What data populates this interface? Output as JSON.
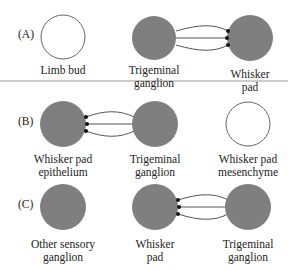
{
  "colors": {
    "filled": "#7f7f7f",
    "outline": "#555555",
    "axon": "#555555",
    "terminal": "#111111",
    "divider": "#999999"
  },
  "panels": [
    {
      "id": "A",
      "label": "(A)",
      "nodes": [
        {
          "name": "limb-bud",
          "lines": [
            "Limb bud"
          ],
          "filled": false
        },
        {
          "name": "trigeminal-ganglion",
          "lines": [
            "Trigeminal",
            "ganglion"
          ],
          "filled": true
        },
        {
          "name": "whisker-pad",
          "lines": [
            "Whisker",
            "pad"
          ],
          "filled": true
        }
      ],
      "connection": "trigeminal-ganglion -> whisker-pad"
    },
    {
      "id": "B",
      "label": "(B)",
      "nodes": [
        {
          "name": "whisker-pad-epithelium",
          "lines": [
            "Whisker pad",
            "epithelium"
          ],
          "filled": true
        },
        {
          "name": "trigeminal-ganglion",
          "lines": [
            "Trigeminal",
            "ganglion"
          ],
          "filled": true
        },
        {
          "name": "whisker-pad-mesenchyme",
          "lines": [
            "Whisker pad",
            "mesenchyme"
          ],
          "filled": false
        }
      ],
      "connection": "trigeminal-ganglion -> whisker-pad-epithelium"
    },
    {
      "id": "C",
      "label": "(C)",
      "nodes": [
        {
          "name": "other-sensory-ganglion",
          "lines": [
            "Other sensory",
            "ganglion"
          ],
          "filled": true
        },
        {
          "name": "whisker-pad",
          "lines": [
            "Whisker",
            "pad"
          ],
          "filled": true
        },
        {
          "name": "trigeminal-ganglion",
          "lines": [
            "Trigeminal",
            "ganglion"
          ],
          "filled": true
        }
      ],
      "connection": "trigeminal-ganglion -> whisker-pad"
    }
  ]
}
